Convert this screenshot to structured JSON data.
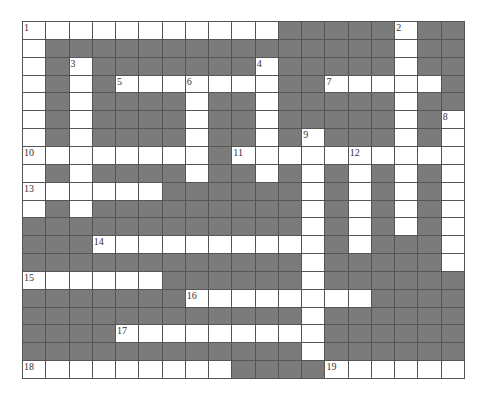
{
  "puzzle": {
    "rows": 20,
    "cols": 19,
    "colors": {
      "block": "#7b7b7b",
      "open": "#ffffff",
      "line": "#555555"
    },
    "grid": [
      "...........#####.##",
      ".###############.##",
      ".#.#######.#####.##",
      ".#.#.......##.....#",
      ".#.####.##.#####.##",
      ".#.####.##.#####.#.",
      ".#.####.##.#.###.#.",
      "........#..........",
      ".#.####.##.#.#.#.#.",
      "......######.#.#.#.",
      ".#.#########.#.#.#.",
      "############.#.#.#.",
      "###..........#.###.",
      "############.#####.",
      "......######.######",
      "#######........####",
      "############.######",
      "####.........######",
      "############.######",
      ".........####......"
    ],
    "numbers": [
      {
        "label": "1",
        "row": 0,
        "col": 0
      },
      {
        "label": "2",
        "row": 0,
        "col": 16
      },
      {
        "label": "3",
        "row": 2,
        "col": 2
      },
      {
        "label": "4",
        "row": 2,
        "col": 10
      },
      {
        "label": "5",
        "row": 3,
        "col": 4
      },
      {
        "label": "6",
        "row": 3,
        "col": 7
      },
      {
        "label": "7",
        "row": 3,
        "col": 13
      },
      {
        "label": "8",
        "row": 5,
        "col": 18
      },
      {
        "label": "9",
        "row": 6,
        "col": 12
      },
      {
        "label": "10",
        "row": 7,
        "col": 0
      },
      {
        "label": "11",
        "row": 7,
        "col": 9
      },
      {
        "label": "12",
        "row": 7,
        "col": 14
      },
      {
        "label": "13",
        "row": 9,
        "col": 0
      },
      {
        "label": "14",
        "row": 12,
        "col": 3
      },
      {
        "label": "15",
        "row": 14,
        "col": 0
      },
      {
        "label": "16",
        "row": 15,
        "col": 7
      },
      {
        "label": "17",
        "row": 17,
        "col": 4
      },
      {
        "label": "18",
        "row": 19,
        "col": 0
      },
      {
        "label": "19",
        "row": 19,
        "col": 13
      }
    ]
  }
}
